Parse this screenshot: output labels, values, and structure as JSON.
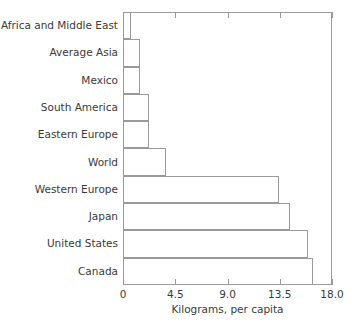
{
  "chart_data": {
    "type": "bar",
    "orientation": "horizontal",
    "title": "",
    "xlabel": "Kilograms, per capita",
    "ylabel": "",
    "categories": [
      "Africa and Middle East",
      "Average Asia",
      "Mexico",
      "South America",
      "Eastern Europe",
      "World",
      "Western Europe",
      "Japan",
      "United States",
      "Canada"
    ],
    "values": [
      0.7,
      1.5,
      1.5,
      2.2,
      2.2,
      3.7,
      13.4,
      14.4,
      15.9,
      16.4
    ],
    "xlim": [
      0,
      18.0
    ],
    "xticks": [
      0,
      4.5,
      9.0,
      13.5,
      18.0
    ],
    "xticklabels": [
      "0",
      "4.5",
      "9.0",
      "13.5",
      "18.0"
    ],
    "grid": false,
    "legend": null,
    "bar_fill_color": "#ffffff",
    "bar_edge_color": "#9a9a9a",
    "axis_color": "#9a9a9a",
    "text_color": "#3a3a3a",
    "background_color": "#ffffff"
  }
}
